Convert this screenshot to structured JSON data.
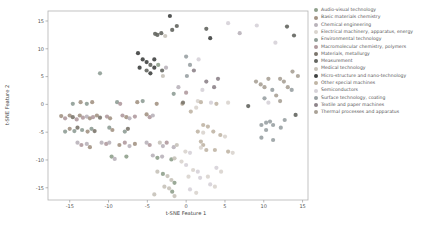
{
  "chart_data": {
    "type": "scatter",
    "title": "",
    "xlabel": "t-SNE Feature 1",
    "ylabel": "t-SNE Feature 2",
    "xlim": [
      -17.8,
      15.7
    ],
    "ylim": [
      -17.2,
      16.8
    ],
    "x_ticks": [
      -15,
      -10,
      -5,
      0,
      5,
      10,
      15
    ],
    "y_ticks": [
      -15,
      -10,
      -5,
      0,
      5,
      10,
      15
    ],
    "grid": false,
    "legend_position": "right-outside",
    "marker": "circle",
    "categories": [
      {
        "label": "Audio-visual technology",
        "color": "#8fa08c"
      },
      {
        "label": "Basic materials chemistry",
        "color": "#a39384"
      },
      {
        "label": "Chemical engineering",
        "color": "#b9b3ba"
      },
      {
        "label": "Electrical machinery, apparatus, energy",
        "color": "#d9d4ce"
      },
      {
        "label": "Environmental technology",
        "color": "#8f9d96"
      },
      {
        "label": "Macromolecular chemistry, polymers",
        "color": "#b09a9e"
      },
      {
        "label": "Materials, metallurgy",
        "color": "#7b756c"
      },
      {
        "label": "Measurement",
        "color": "#63655f"
      },
      {
        "label": "Medical technology",
        "color": "#c7c2b9"
      },
      {
        "label": "Micro-structure and nano-technology",
        "color": "#3f4140"
      },
      {
        "label": "Other special machines",
        "color": "#c0b5a5"
      },
      {
        "label": "Semiconductors",
        "color": "#d6d2d8"
      },
      {
        "label": "Surface technology, coating",
        "color": "#99a1a3"
      },
      {
        "label": "Textile and paper machines",
        "color": "#8d8389"
      },
      {
        "label": "Thermal processes and apparatus",
        "color": "#a9a196"
      }
    ],
    "points": [
      [
        -2.1,
        15.9,
        9
      ],
      [
        -4.0,
        12.7,
        7
      ],
      [
        -3.7,
        12.5,
        7
      ],
      [
        -3.2,
        12.8,
        7
      ],
      [
        -2.7,
        12.3,
        8
      ],
      [
        -1.2,
        14.1,
        7
      ],
      [
        -1.8,
        13.4,
        7
      ],
      [
        2.6,
        13.6,
        7
      ],
      [
        5.4,
        14.6,
        11
      ],
      [
        3.1,
        11.9,
        9
      ],
      [
        9.1,
        14.2,
        11
      ],
      [
        13.0,
        14.0,
        7
      ],
      [
        13.9,
        12.4,
        7
      ],
      [
        6.9,
        12.8,
        2
      ],
      [
        11.5,
        11.1,
        11
      ],
      [
        -6.2,
        9.2,
        9
      ],
      [
        -5.6,
        8.1,
        9
      ],
      [
        -5.1,
        7.6,
        9
      ],
      [
        -4.6,
        7.1,
        7
      ],
      [
        -4.1,
        6.6,
        9
      ],
      [
        -5.1,
        6.1,
        7
      ],
      [
        -6.0,
        6.6,
        9
      ],
      [
        -4.1,
        8.1,
        9
      ],
      [
        -3.6,
        7.1,
        0
      ],
      [
        -4.6,
        5.6,
        9
      ],
      [
        -3.1,
        6.1,
        7
      ],
      [
        -2.6,
        6.6,
        2
      ],
      [
        -3.0,
        5.1,
        8
      ],
      [
        -11.1,
        5.6,
        4
      ],
      [
        0.0,
        8.6,
        12
      ],
      [
        0.5,
        7.1,
        12
      ],
      [
        1.0,
        6.1,
        13
      ],
      [
        0.1,
        5.1,
        12
      ],
      [
        1.6,
        8.1,
        11
      ],
      [
        2.6,
        4.1,
        13
      ],
      [
        3.6,
        3.1,
        13
      ],
      [
        2.1,
        2.6,
        11
      ],
      [
        4.1,
        4.6,
        13
      ],
      [
        9.0,
        4.1,
        14
      ],
      [
        9.6,
        3.6,
        14
      ],
      [
        10.1,
        3.1,
        14
      ],
      [
        10.6,
        4.6,
        14
      ],
      [
        11.1,
        2.6,
        12
      ],
      [
        12.1,
        4.6,
        14
      ],
      [
        12.6,
        4.1,
        14
      ],
      [
        13.1,
        3.1,
        14
      ],
      [
        13.6,
        2.6,
        12
      ],
      [
        11.6,
        1.6,
        14
      ],
      [
        10.1,
        1.1,
        12
      ],
      [
        12.1,
        0.6,
        14
      ],
      [
        13.7,
        5.9,
        14
      ],
      [
        14.4,
        5.1,
        14
      ],
      [
        -1.0,
        3.1,
        2
      ],
      [
        0.0,
        2.1,
        5
      ],
      [
        1.5,
        0.6,
        3
      ],
      [
        -0.5,
        0.1,
        10
      ],
      [
        -1.6,
        1.9,
        4
      ],
      [
        -14.6,
        0.1,
        4
      ],
      [
        -13.6,
        0.4,
        1
      ],
      [
        -12.8,
        0.1,
        4
      ],
      [
        -12.1,
        0.4,
        1
      ],
      [
        -8.9,
        0.4,
        4
      ],
      [
        -8.5,
        0.1,
        5
      ],
      [
        -6.3,
        0.4,
        1
      ],
      [
        -5.6,
        0.6,
        4
      ],
      [
        -3.8,
        0.1,
        1
      ],
      [
        -16.1,
        -2.1,
        1
      ],
      [
        -15.6,
        -2.5,
        5
      ],
      [
        -15.0,
        -2.0,
        1
      ],
      [
        -14.6,
        -2.3,
        6
      ],
      [
        -14.1,
        -2.7,
        5
      ],
      [
        -13.7,
        -2.0,
        1
      ],
      [
        -13.3,
        -2.4,
        5
      ],
      [
        -12.8,
        -2.2,
        2
      ],
      [
        -12.4,
        -2.5,
        1
      ],
      [
        -12.0,
        -2.3,
        5
      ],
      [
        -11.5,
        -2.0,
        1
      ],
      [
        -11.1,
        -2.4,
        6
      ],
      [
        -10.2,
        -2.2,
        5
      ],
      [
        -9.8,
        -2.5,
        1
      ],
      [
        -8.2,
        -2.0,
        5
      ],
      [
        -7.7,
        -2.3,
        1
      ],
      [
        -7.3,
        -2.5,
        2
      ],
      [
        -6.6,
        -2.2,
        5
      ],
      [
        -5.1,
        -1.8,
        1
      ],
      [
        -4.7,
        -2.3,
        5
      ],
      [
        -4.3,
        -2.0,
        2
      ],
      [
        -15.6,
        -4.9,
        4
      ],
      [
        -15.0,
        -4.4,
        1
      ],
      [
        -14.4,
        -4.8,
        4
      ],
      [
        -14.0,
        -4.2,
        6
      ],
      [
        -13.4,
        -4.6,
        4
      ],
      [
        -12.7,
        -4.9,
        1
      ],
      [
        -12.2,
        -4.4,
        4
      ],
      [
        -11.8,
        -4.8,
        6
      ],
      [
        -9.9,
        -4.2,
        4
      ],
      [
        -9.5,
        -4.6,
        1
      ],
      [
        -7.9,
        -4.9,
        4
      ],
      [
        -7.5,
        -4.4,
        6
      ],
      [
        -14.0,
        -6.9,
        2
      ],
      [
        -13.5,
        -7.3,
        5
      ],
      [
        -12.8,
        -7.1,
        2
      ],
      [
        -12.4,
        -7.7,
        1
      ],
      [
        -10.9,
        -6.9,
        2
      ],
      [
        -10.3,
        -7.1,
        5
      ],
      [
        -9.9,
        -6.9,
        2
      ],
      [
        -8.6,
        -7.3,
        1
      ],
      [
        -7.9,
        -6.9,
        5
      ],
      [
        -7.3,
        -7.5,
        2
      ],
      [
        -6.6,
        -7.1,
        1
      ],
      [
        -5.1,
        -6.9,
        2
      ],
      [
        -4.7,
        -7.3,
        5
      ],
      [
        -3.4,
        -6.9,
        8
      ],
      [
        -3.0,
        -7.5,
        2
      ],
      [
        -2.5,
        -6.9,
        5
      ],
      [
        -1.6,
        -7.7,
        2
      ],
      [
        -1.2,
        -7.3,
        8
      ],
      [
        -9.6,
        -9.4,
        0
      ],
      [
        -9.2,
        -9.8,
        2
      ],
      [
        -7.7,
        -9.4,
        0
      ],
      [
        -4.3,
        -9.2,
        2
      ],
      [
        -3.7,
        -9.6,
        0
      ],
      [
        -3.1,
        -9.4,
        2
      ],
      [
        -1.9,
        -9.9,
        0
      ],
      [
        -1.5,
        -9.7,
        8
      ],
      [
        -3.7,
        -12.1,
        8
      ],
      [
        -3.0,
        -12.5,
        0
      ],
      [
        -2.4,
        -12.9,
        8
      ],
      [
        -1.9,
        -13.6,
        8
      ],
      [
        -1.5,
        -14.1,
        0
      ],
      [
        -2.8,
        -14.8,
        8
      ],
      [
        -2.2,
        -15.1,
        8
      ],
      [
        -1.8,
        -15.7,
        0
      ],
      [
        -4.1,
        -16.2,
        8
      ],
      [
        -1.5,
        -16.5,
        8
      ],
      [
        2.2,
        -3.7,
        10
      ],
      [
        2.8,
        -4.0,
        10
      ],
      [
        1.5,
        -4.9,
        10
      ],
      [
        2.2,
        -5.1,
        3
      ],
      [
        3.5,
        -4.9,
        10
      ],
      [
        4.4,
        -5.5,
        10
      ],
      [
        5.0,
        -5.8,
        3
      ],
      [
        1.9,
        -6.7,
        10
      ],
      [
        2.2,
        -7.3,
        10
      ],
      [
        1.9,
        -7.8,
        3
      ],
      [
        2.6,
        -8.2,
        10
      ],
      [
        3.7,
        -8.2,
        10
      ],
      [
        5.4,
        -8.5,
        10
      ],
      [
        6.0,
        -8.7,
        3
      ],
      [
        -0.4,
        0.3,
        6
      ],
      [
        0.6,
        -1.3,
        10
      ],
      [
        1.3,
        -0.6,
        3
      ],
      [
        1.9,
        0.4,
        10
      ],
      [
        3.2,
        0.3,
        11
      ],
      [
        3.9,
        0.1,
        10
      ],
      [
        5.4,
        0.3,
        3
      ],
      [
        8.0,
        -0.3,
        7
      ],
      [
        10.6,
        0.3,
        11
      ],
      [
        14.1,
        -1.9,
        7
      ],
      [
        9.7,
        -3.7,
        12
      ],
      [
        10.3,
        -3.3,
        12
      ],
      [
        10.8,
        -3.1,
        12
      ],
      [
        11.2,
        -3.7,
        12
      ],
      [
        10.3,
        -4.6,
        12
      ],
      [
        9.7,
        -6.0,
        12
      ],
      [
        11.2,
        -6.4,
        12
      ],
      [
        12.7,
        -2.8,
        12
      ],
      [
        12.2,
        -4.2,
        12
      ],
      [
        -0.1,
        -8.5,
        3
      ],
      [
        0.5,
        -8.7,
        11
      ],
      [
        -0.6,
        -10.3,
        3
      ],
      [
        0.0,
        -10.9,
        11
      ],
      [
        0.9,
        -11.8,
        3
      ],
      [
        1.5,
        -12.1,
        11
      ],
      [
        0.3,
        -13.0,
        3
      ],
      [
        1.8,
        -13.2,
        11
      ],
      [
        2.8,
        -13.0,
        3
      ],
      [
        3.9,
        -11.4,
        11
      ],
      [
        4.5,
        -12.1,
        3
      ],
      [
        3.1,
        -14.4,
        11
      ],
      [
        3.7,
        -14.8,
        3
      ],
      [
        0.5,
        -15.3,
        11
      ],
      [
        1.3,
        -15.9,
        3
      ]
    ],
    "style": {
      "spine_color": "#b3b3b3",
      "tick_color": "#999999",
      "point_radius": 2.1,
      "point_opacity": 0.9,
      "background": "#ffffff"
    }
  }
}
